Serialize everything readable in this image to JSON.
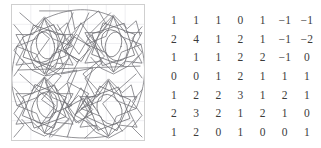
{
  "figure": {
    "panel": {
      "border_color": "#cfcfcf",
      "background": "#ffffff",
      "grid_color": "#e3e3e8",
      "grid_cols": 7,
      "grid_rows": 7
    },
    "stroke_color": "#6e6e73",
    "stroke_width": 0.7
  },
  "matrix": {
    "name": "integer-matrix",
    "rows": 7,
    "cols": 7,
    "values": [
      [
        "1",
        "1",
        "1",
        "0",
        "1",
        "−1",
        "−1"
      ],
      [
        "2",
        "4",
        "1",
        "2",
        "1",
        "−1",
        "−2"
      ],
      [
        "1",
        "1",
        "1",
        "2",
        "2",
        "−1",
        "0"
      ],
      [
        "0",
        "0",
        "1",
        "2",
        "1",
        "1",
        "1"
      ],
      [
        "1",
        "2",
        "2",
        "3",
        "1",
        "2",
        "1"
      ],
      [
        "2",
        "3",
        "2",
        "1",
        "2",
        "1",
        "0"
      ],
      [
        "1",
        "2",
        "0",
        "1",
        "0",
        "0",
        "1"
      ]
    ],
    "text_color": "#3b3b3b"
  }
}
